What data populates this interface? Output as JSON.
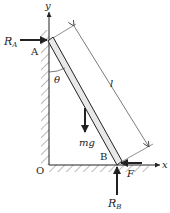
{
  "figure": {
    "labels": {
      "y_axis": "y",
      "x_axis": "x",
      "origin": "O",
      "point_top": "A",
      "point_bottom": "B",
      "angle": "θ",
      "length": "l",
      "weight": "mg",
      "reaction_wall": "R",
      "reaction_wall_sub": "A",
      "reaction_floor": "R",
      "reaction_floor_sub": "B",
      "friction": "F"
    },
    "colors": {
      "ink": "#222222",
      "ladder_fill": "#e8e8e8",
      "hatch": "#666666",
      "background": "#ffffff"
    }
  }
}
